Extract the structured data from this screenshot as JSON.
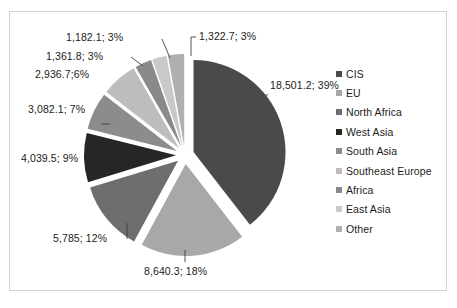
{
  "chart_data": {
    "type": "pie",
    "title": "",
    "units": "",
    "total": 46851.4,
    "categories": [
      "CIS",
      "EU",
      "North Africa",
      "West Asia",
      "South Asia",
      "Southeast Europe",
      "Africa",
      "East Asia",
      "Other"
    ],
    "values": [
      18501.2,
      8640.3,
      5785,
      4039.5,
      3082.1,
      2936.7,
      1361.8,
      1182.1,
      1322.7
    ],
    "percents": [
      39,
      18,
      12,
      9,
      7,
      6,
      3,
      3,
      3
    ],
    "colors": [
      "#4a4a4a",
      "#a8a8a8",
      "#6e6e6e",
      "#262626",
      "#8c8c8c",
      "#bdbdbd",
      "#8a8a8a",
      "#c9c9c9",
      "#b0b0b0"
    ],
    "data_labels": [
      "18,501.2; 39%",
      "8,640.3; 18%",
      "5,785; 12%",
      "4,039.5; 9%",
      "3,082.1; 7%",
      "2,936.7;6%",
      "1,361.8; 3%",
      "1,182.1; 3%",
      "1,322.7; 3%"
    ],
    "legend_position": "right",
    "exploded": true,
    "grid": false,
    "xlabel": "",
    "ylabel": ""
  },
  "legend": {
    "items": [
      {
        "label": "CIS",
        "color": "#4a4a4a"
      },
      {
        "label": "EU",
        "color": "#a8a8a8"
      },
      {
        "label": "North Africa",
        "color": "#6e6e6e"
      },
      {
        "label": "West Asia",
        "color": "#262626"
      },
      {
        "label": "South Asia",
        "color": "#8c8c8c"
      },
      {
        "label": "Southeast Europe",
        "color": "#bdbdbd"
      },
      {
        "label": "Africa",
        "color": "#8a8a8a"
      },
      {
        "label": "East Asia",
        "color": "#c9c9c9"
      },
      {
        "label": "Other",
        "color": "#b0b0b0"
      }
    ]
  },
  "frame": {
    "border_color": "#d2d2d2",
    "background": "#ffffff"
  }
}
